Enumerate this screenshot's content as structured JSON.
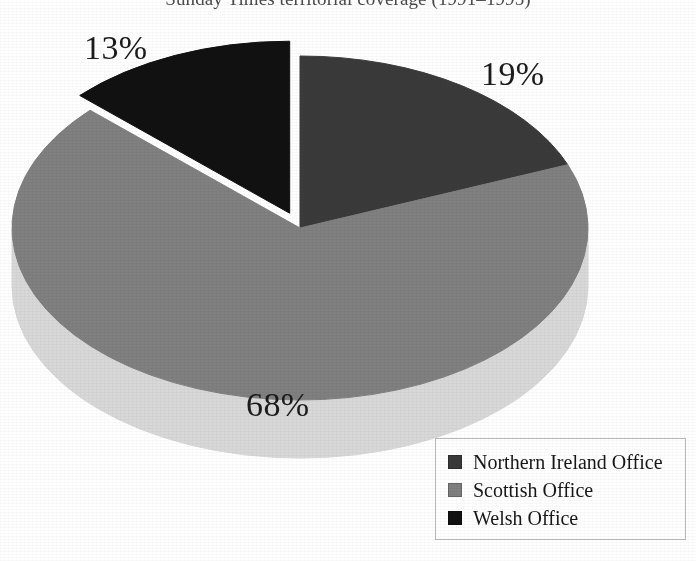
{
  "title": "Sunday Times territorial coverage (1991–1995)",
  "chart_data": {
    "type": "pie",
    "title": "Sunday Times territorial coverage (1991–1995)",
    "xlabel": "",
    "ylabel": "",
    "units": "percent",
    "three_d": true,
    "exploded_slices": [
      "Welsh Office"
    ],
    "legend_position": "bottom-right",
    "grid": false,
    "categories": [
      "Northern Ireland Office",
      "Scottish Office",
      "Welsh Office"
    ],
    "values": [
      19,
      68,
      13
    ],
    "labels": [
      "19%",
      "68%",
      "13%"
    ],
    "colors": [
      "#3a3a3a",
      "#808080",
      "#111111"
    ],
    "side_colors": [
      "#2a2a2a",
      "#d8d8d8",
      "#0c0c0c"
    ],
    "slices": [
      {
        "name": "Northern Ireland Office",
        "value": 19,
        "label": "19%",
        "color": "#3a3a3a",
        "side_color": "#2a2a2a",
        "exploded": false
      },
      {
        "name": "Scottish Office",
        "value": 68,
        "label": "68%",
        "color": "#808080",
        "side_color": "#d8d8d8",
        "exploded": false
      },
      {
        "name": "Welsh Office",
        "value": 13,
        "label": "13%",
        "color": "#111111",
        "side_color": "#0c0c0c",
        "exploded": true
      }
    ]
  },
  "callouts": {
    "northern": "19%",
    "scottish": "68%",
    "welsh": "13%"
  },
  "legend": {
    "items": [
      {
        "label": "Northern Ireland Office",
        "color": "#3a3a3a"
      },
      {
        "label": "Scottish Office",
        "color": "#808080"
      },
      {
        "label": "Welsh Office",
        "color": "#111111"
      }
    ]
  }
}
